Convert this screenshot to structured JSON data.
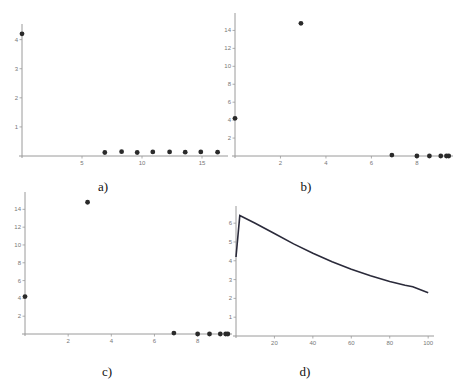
{
  "chart_data": [
    {
      "id": "a",
      "type": "scatter",
      "caption": "a)",
      "title": "",
      "xlabel": "",
      "ylabel": "",
      "xlim": [
        0,
        17
      ],
      "ylim": [
        0,
        4.4
      ],
      "xticks": [
        5,
        10,
        15
      ],
      "yticks": [
        1,
        2,
        3,
        4
      ],
      "x": [
        0,
        6.9,
        8.3,
        9.6,
        10.9,
        12.3,
        13.6,
        14.9,
        16.3
      ],
      "y": [
        4.2,
        0.12,
        0.15,
        0.12,
        0.14,
        0.14,
        0.13,
        0.14,
        0.13
      ],
      "grid": false
    },
    {
      "id": "b",
      "type": "scatter",
      "caption": "b)",
      "title": "",
      "xlabel": "",
      "ylabel": "",
      "xlim": [
        0,
        9.5
      ],
      "ylim": [
        0,
        15.5
      ],
      "xticks": [
        2,
        4,
        6,
        8
      ],
      "yticks": [
        2,
        4,
        6,
        8,
        10,
        12,
        14
      ],
      "x": [
        0,
        2.9,
        6.9,
        8.0,
        8.55,
        9.05,
        9.3,
        9.4
      ],
      "y": [
        4.2,
        14.8,
        0.1,
        0.0,
        0.0,
        0.0,
        0.0,
        0.0
      ],
      "grid": false
    },
    {
      "id": "c",
      "type": "scatter",
      "caption": "c)",
      "title": "",
      "xlabel": "",
      "ylabel": "",
      "xlim": [
        0,
        9.5
      ],
      "ylim": [
        0,
        15.5
      ],
      "xticks": [
        2,
        4,
        6,
        8
      ],
      "yticks": [
        2,
        4,
        6,
        8,
        10,
        12,
        14
      ],
      "x": [
        0,
        2.9,
        6.9,
        8.0,
        8.55,
        9.05,
        9.3,
        9.4
      ],
      "y": [
        4.2,
        14.8,
        0.1,
        0.0,
        0.0,
        0.0,
        0.0,
        0.0
      ],
      "grid": false
    },
    {
      "id": "d",
      "type": "line",
      "caption": "d)",
      "title": "",
      "xlabel": "",
      "ylabel": "",
      "xlim": [
        0,
        102
      ],
      "ylim": [
        0,
        6.7
      ],
      "xticks": [
        20,
        40,
        60,
        80,
        100
      ],
      "yticks": [
        1,
        2,
        3,
        4,
        5,
        6
      ],
      "x": [
        0,
        2,
        10,
        20,
        30,
        40,
        50,
        60,
        70,
        80,
        88,
        92,
        100
      ],
      "y": [
        4.2,
        6.4,
        6.0,
        5.45,
        4.9,
        4.4,
        3.95,
        3.55,
        3.2,
        2.9,
        2.7,
        2.62,
        2.3
      ],
      "grid": false
    }
  ]
}
